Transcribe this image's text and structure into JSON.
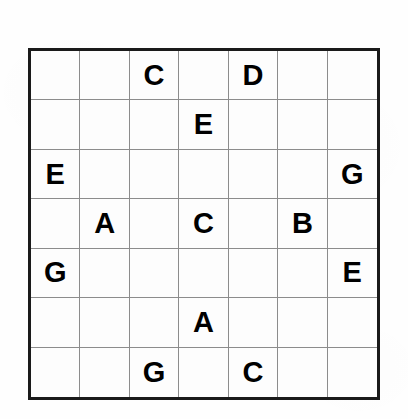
{
  "puzzle": {
    "type": "letter-sudoku",
    "size": 7,
    "alphabet": [
      "A",
      "B",
      "C",
      "D",
      "E",
      "F",
      "G"
    ],
    "colors": {
      "page_background": "#fefefe",
      "grid_background": "#fdfdfd",
      "outer_border": "#1a1a1a",
      "inner_line": "#8c8c8c",
      "letter": "#000000"
    },
    "rows": [
      [
        "",
        "",
        "C",
        "",
        "D",
        "",
        ""
      ],
      [
        "",
        "",
        "",
        "E",
        "",
        "",
        ""
      ],
      [
        "E",
        "",
        "",
        "",
        "",
        "",
        "G"
      ],
      [
        "",
        "A",
        "",
        "C",
        "",
        "B",
        ""
      ],
      [
        "G",
        "",
        "",
        "",
        "",
        "",
        "E"
      ],
      [
        "",
        "",
        "",
        "A",
        "",
        "",
        ""
      ],
      [
        "",
        "",
        "G",
        "",
        "C",
        "",
        ""
      ]
    ]
  }
}
